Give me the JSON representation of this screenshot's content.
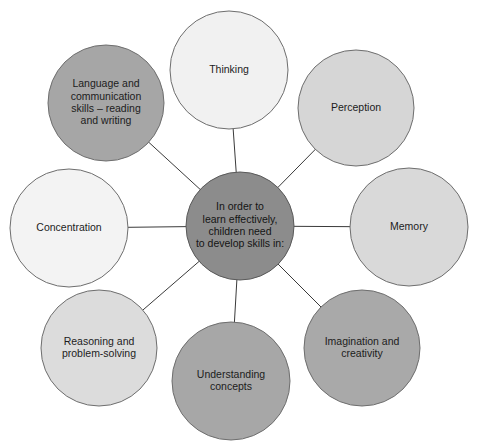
{
  "diagram": {
    "type": "radial-hub-and-spoke",
    "title_text": "In order to learn effectively, children need to develop skills in:",
    "center": {
      "id": "center-hub",
      "lines": [
        "In order to",
        "learn effectively,",
        "children need",
        "to develop skills in:"
      ],
      "fill": "#8c8c8c",
      "stroke": "#5a5a5a",
      "cx": 240,
      "cy": 226,
      "r": 54
    },
    "nodes": [
      {
        "id": "thinking",
        "lines": [
          "Thinking"
        ],
        "fill": "#f1f1f1",
        "stroke": "#7a7a7a",
        "cx": 229,
        "cy": 70,
        "r": 59
      },
      {
        "id": "perception",
        "lines": [
          "Perception"
        ],
        "fill": "#d6d6d6",
        "stroke": "#6e6e6e",
        "cx": 356,
        "cy": 108,
        "r": 58
      },
      {
        "id": "memory",
        "lines": [
          "Memory"
        ],
        "fill": "#d9d9d9",
        "stroke": "#6e6e6e",
        "cx": 409,
        "cy": 227,
        "r": 59
      },
      {
        "id": "imagination-and-creativity",
        "lines": [
          "Imagination and",
          "creativity"
        ],
        "fill": "#a9a9a9",
        "stroke": "#6e6e6e",
        "cx": 362,
        "cy": 348,
        "r": 58
      },
      {
        "id": "understanding-concepts",
        "lines": [
          "Understanding",
          "concepts"
        ],
        "fill": "#a7a7a7",
        "stroke": "#6e6e6e",
        "cx": 231,
        "cy": 381,
        "r": 59
      },
      {
        "id": "reasoning-and-problem-solving",
        "lines": [
          "Reasoning and",
          "problem-solving"
        ],
        "fill": "#dcdcdc",
        "stroke": "#6e6e6e",
        "cx": 99,
        "cy": 348,
        "r": 58
      },
      {
        "id": "concentration",
        "lines": [
          "Concentration"
        ],
        "fill": "#f3f3f3",
        "stroke": "#7a7a7a",
        "cx": 69,
        "cy": 228,
        "r": 59
      },
      {
        "id": "language-and-communication",
        "lines": [
          "Language and",
          "communication",
          "skills – reading",
          "and writing"
        ],
        "fill": "#a6a6a6",
        "stroke": "#6e6e6e",
        "cx": 106,
        "cy": 103,
        "r": 58
      }
    ],
    "colors": {
      "background": "#ffffff",
      "line": "#3a3a3a",
      "text": "#1c1c1c",
      "center_fill": "#8c8c8c"
    }
  }
}
